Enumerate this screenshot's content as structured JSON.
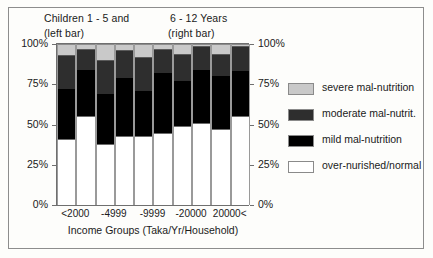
{
  "figure": {
    "border_color": "#8d8d8d",
    "background": "#fdfdfb"
  },
  "titles": {
    "left_line1": "Children 1 - 5   and",
    "left_line2": "(left bar)",
    "right_line1": "6 - 12 Years",
    "right_line2": "(right bar)"
  },
  "legend": {
    "items": [
      {
        "label": "severe mal-nutrition",
        "color": "#c9c9c9"
      },
      {
        "label": "moderate mal-nutrit.",
        "color": "#2e2e2e"
      },
      {
        "label": "mild mal-nutrition",
        "color": "#000000"
      },
      {
        "label": "over-nurished/normal",
        "color": "#ffffff"
      }
    ]
  },
  "axes": {
    "y_left_ticks": [
      "100%",
      "75%",
      "50%",
      "25%",
      "0%"
    ],
    "y_right_ticks": [
      "100%",
      "75%",
      "50%",
      "25%",
      "0%"
    ],
    "y_values": [
      100,
      75,
      50,
      25,
      0
    ],
    "x_title": "Income Groups (Taka/Yr/Household)",
    "x_tick_labels": [
      "<2000",
      "-4999",
      "-9999",
      "-20000",
      "20000<"
    ]
  },
  "chart_data": {
    "type": "bar",
    "subtype": "stacked-100-percent",
    "title": "Children 1 - 5   and   6 - 12 Years",
    "xlabel": "Income Groups (Taka/Yr/Household)",
    "ylabel": "",
    "ylim": [
      0,
      100
    ],
    "yunit": "%",
    "grid": false,
    "legend_position": "right",
    "categories": [
      "<2000",
      "-4999",
      "-9999",
      "-20000",
      "20000<"
    ],
    "group_labels": [
      "Children 1 - 5 (left bar)",
      "6 - 12 Years (right bar)"
    ],
    "stack_order_bottom_to_top": [
      "over-nurished/normal",
      "mild mal-nutrition",
      "moderate mal-nutrit.",
      "severe mal-nutrition"
    ],
    "series": [
      {
        "name": "over-nurished/normal",
        "color": "#ffffff",
        "age_1_5": [
          41,
          38,
          43,
          49,
          47
        ],
        "age_6_12": [
          55,
          43,
          45,
          51,
          55
        ]
      },
      {
        "name": "mild mal-nutrition",
        "color": "#000000",
        "age_1_5": [
          31,
          31,
          28,
          28,
          33
        ],
        "age_6_12": [
          29,
          36,
          37,
          33,
          28
        ]
      },
      {
        "name": "moderate mal-nutrit.",
        "color": "#2e2e2e",
        "age_1_5": [
          21,
          21,
          21,
          17,
          14
        ],
        "age_6_12": [
          13,
          17,
          15,
          15,
          16
        ]
      },
      {
        "name": "severe mal-nutrition",
        "color": "#c9c9c9",
        "age_1_5": [
          7,
          10,
          8,
          6,
          6
        ],
        "age_6_12": [
          3,
          4,
          3,
          1,
          1
        ]
      }
    ],
    "cumulative_tops": {
      "age_1_5": {
        "normal": [
          41,
          38,
          43,
          49,
          47
        ],
        "mild": [
          72,
          69,
          71,
          77,
          80
        ],
        "moderate": [
          93,
          90,
          92,
          94,
          94
        ],
        "severe": [
          100,
          100,
          100,
          100,
          100
        ]
      },
      "age_6_12": {
        "normal": [
          55,
          43,
          45,
          51,
          55
        ],
        "mild": [
          84,
          79,
          82,
          84,
          83
        ],
        "moderate": [
          97,
          96,
          97,
          99,
          99
        ],
        "severe": [
          100,
          100,
          100,
          100,
          100
        ]
      }
    }
  }
}
